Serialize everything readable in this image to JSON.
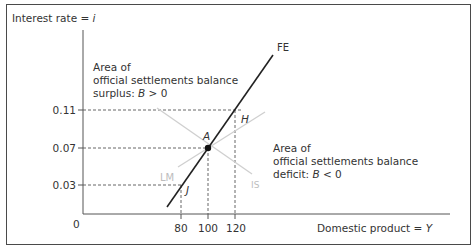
{
  "diagram": {
    "type": "IS-LM-FE balance of payments diagram",
    "y_axis": {
      "label_prefix": "Interest rate = ",
      "label_var": "i"
    },
    "x_axis": {
      "label_prefix": "Domestic product = ",
      "label_var": "Y"
    },
    "origin_label": "0",
    "y_ticks": [
      "0.11",
      "0.07",
      "0.03"
    ],
    "x_ticks": [
      "80",
      "100",
      "120"
    ],
    "curves": {
      "fe": "FE",
      "lm": "LM",
      "is": "IS"
    },
    "points": {
      "a": "A",
      "h": "H",
      "j": "J"
    },
    "surplus_area": {
      "line1": "Area of",
      "line2": "official settlements balance",
      "line3_prefix": "surplus: ",
      "line3_var": "B",
      "line3_suffix": " > 0"
    },
    "deficit_area": {
      "line1": "Area of",
      "line2": "official settlements balance",
      "line3_prefix": "deficit: ",
      "line3_var": "B",
      "line3_suffix": " < 0"
    },
    "colors": {
      "frame": "#4a4a4a",
      "axis": "#555555",
      "fe_line": "#222222",
      "is_lm_line": "#cfcfcf",
      "dashed": "#555555",
      "text": "#333333"
    }
  }
}
